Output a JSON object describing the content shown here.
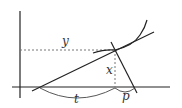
{
  "diagram": {
    "labels": {
      "y": "y",
      "x": "x",
      "t": "t",
      "p": "p"
    },
    "colors": {
      "stroke": "#222222",
      "dotted": "#777777",
      "label": "#333333",
      "background": "#ffffff"
    }
  }
}
